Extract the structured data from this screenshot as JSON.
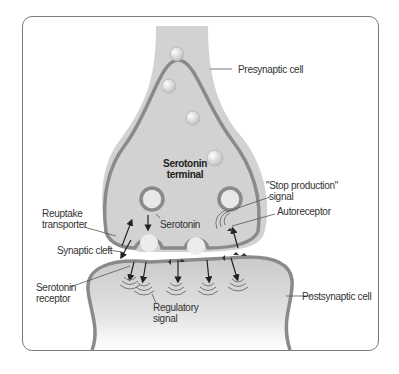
{
  "diagram": {
    "title_labels": {
      "terminal_line1": "Serotonin",
      "terminal_line2": "terminal"
    },
    "labels": {
      "presynaptic_cell": "Presynaptic cell",
      "stop_production_line1": "\"Stop production\"",
      "stop_production_line2": "signal",
      "autoreceptor": "Autoreceptor",
      "reuptake_line1": "Reuptake",
      "reuptake_line2": "transporter",
      "serotonin": "Serotonin",
      "synaptic_cleft": "Synaptic cleft",
      "serotonin_receptor_line1": "Serotonin",
      "serotonin_receptor_line2": "receptor",
      "regulatory_line1": "Regulatory",
      "regulatory_line2": "signal",
      "postsynaptic_cell": "Postsynaptic cell"
    },
    "colors": {
      "membrane": "#8a8a8a",
      "cell_fill": "#d4d4d4",
      "vesicle_fill": "#e6e6e6",
      "frame_border": "#7a7a7a",
      "text": "#333333"
    }
  }
}
